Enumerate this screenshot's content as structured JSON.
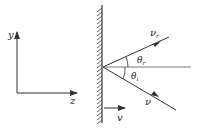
{
  "diagram": {
    "axes": {
      "y_label": "y",
      "x_label": "z"
    },
    "labels": {
      "reflected_velocity": "ν",
      "reflected_sub": "r",
      "incident_velocity": "ν",
      "reflected_angle": "θ",
      "reflected_angle_sub": "r",
      "incident_angle": "θ",
      "incident_angle_sub": "i",
      "mirror_velocity": "v"
    },
    "colors": {
      "line": "#333333",
      "background": "#ffffff"
    }
  }
}
